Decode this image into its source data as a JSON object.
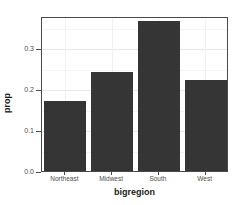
{
  "chart_data": {
    "type": "bar",
    "title": "",
    "subtitle": "",
    "xlabel": "bigregion",
    "ylabel": "prop",
    "categories": [
      "Northeast",
      "Midwest",
      "South",
      "West"
    ],
    "values": [
      0.17,
      0.242,
      0.366,
      0.222
    ],
    "series": [
      {
        "name": "prop",
        "values": [
          0.17,
          0.242,
          0.366,
          0.222
        ]
      }
    ],
    "ylim": [
      0.0,
      0.3775
    ],
    "y_ticks": [
      0.0,
      0.1,
      0.2,
      0.3
    ],
    "y_tick_labels": [
      "0.0",
      "0.1",
      "0.2",
      "0.3"
    ],
    "y_minor_ticks": [
      0.05,
      0.15,
      0.25,
      0.35
    ],
    "grid": true,
    "grid_axis": "both",
    "legend": false,
    "legend_position": "none",
    "bar_color": "#353535",
    "panel_border_color": "#4a4a4a",
    "gridline_major_color": "#e8e8e8",
    "gridline_minor_color": "#f4f4f4",
    "background_color": "#ffffff",
    "axis_text_color": "#4d4d4d",
    "axis_title_color": "#1a1a1a"
  }
}
